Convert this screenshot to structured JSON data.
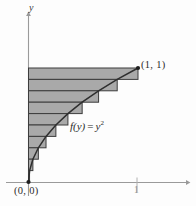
{
  "figure": {
    "axes": {
      "y_axis_label": "y",
      "x_axis_label": "",
      "x_tick_label": "1",
      "origin_label": "(0, 0)",
      "corner_point_label": "(1, 1)"
    },
    "annotations": {
      "function_name": "f(y)",
      "equals": "=",
      "function_body": "y",
      "exponent": "2"
    },
    "colors": {
      "shade_fill": "#a9a9a9",
      "strip_line": "#3c3c3c",
      "curve": "#2f2f2f",
      "axis": "#9a9a9a",
      "label_text": "#2b2b2b",
      "background": "#fdfdfd"
    }
  },
  "chart_data": {
    "type": "area",
    "title": "",
    "xlabel": "",
    "ylabel": "y",
    "xlim": [
      0,
      1.35
    ],
    "ylim": [
      0,
      1.28
    ],
    "grid": false,
    "legend": null,
    "curve": {
      "name": "f(y) = y^2",
      "relation": "x = y^2",
      "points": [
        {
          "x": 0.0,
          "y": 0.0
        },
        {
          "x": 0.01,
          "y": 0.1
        },
        {
          "x": 0.04,
          "y": 0.2
        },
        {
          "x": 0.09,
          "y": 0.3
        },
        {
          "x": 0.16,
          "y": 0.4
        },
        {
          "x": 0.25,
          "y": 0.5
        },
        {
          "x": 0.36,
          "y": 0.6
        },
        {
          "x": 0.49,
          "y": 0.7
        },
        {
          "x": 0.64,
          "y": 0.8
        },
        {
          "x": 0.81,
          "y": 0.9
        },
        {
          "x": 1.0,
          "y": 1.0
        }
      ]
    },
    "rectangles": {
      "description": "Circumscribed horizontal rectangles of height 0.1 spanning from the y-axis to x = y_top^2",
      "count": 10,
      "height": 0.1,
      "strips": [
        {
          "index": 1,
          "y_bottom": 0.0,
          "y_top": 0.1,
          "width": 0.01
        },
        {
          "index": 2,
          "y_bottom": 0.1,
          "y_top": 0.2,
          "width": 0.04
        },
        {
          "index": 3,
          "y_bottom": 0.2,
          "y_top": 0.3,
          "width": 0.09
        },
        {
          "index": 4,
          "y_bottom": 0.3,
          "y_top": 0.4,
          "width": 0.16
        },
        {
          "index": 5,
          "y_bottom": 0.4,
          "y_top": 0.5,
          "width": 0.25
        },
        {
          "index": 6,
          "y_bottom": 0.5,
          "y_top": 0.6,
          "width": 0.36
        },
        {
          "index": 7,
          "y_bottom": 0.6,
          "y_top": 0.7,
          "width": 0.49
        },
        {
          "index": 8,
          "y_bottom": 0.7,
          "y_top": 0.8,
          "width": 0.64
        },
        {
          "index": 9,
          "y_bottom": 0.8,
          "y_top": 0.9,
          "width": 0.81
        },
        {
          "index": 10,
          "y_bottom": 0.9,
          "y_top": 1.0,
          "width": 1.0
        }
      ]
    },
    "markers": [
      {
        "x": 1.0,
        "y": 1.0,
        "label": "(1, 1)"
      },
      {
        "x": 0.0,
        "y": 0.0,
        "label": "(0, 0)"
      }
    ],
    "ticks": {
      "x": [
        {
          "value": 1.0,
          "label": "1"
        }
      ],
      "y": []
    }
  }
}
